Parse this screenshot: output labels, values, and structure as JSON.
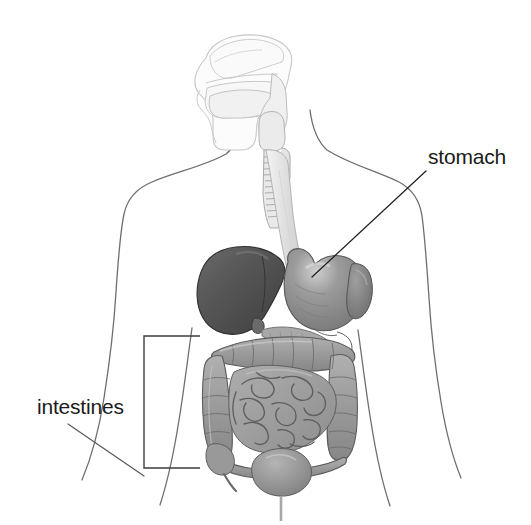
{
  "figure": {
    "kind": "anatomical-illustration",
    "background_color": "#ffffff",
    "width": 531,
    "height": 525
  },
  "labels": [
    {
      "id": "stomach",
      "text": "stomach",
      "color": "#1b1b1b",
      "text_x": 428,
      "text_y": 164,
      "leader": {
        "x1": 426,
        "y1": 171,
        "x2": 312,
        "y2": 277
      },
      "pointer_target": "stomach-organ"
    },
    {
      "id": "intestines",
      "text": "intestines",
      "color": "#1b1b1b",
      "text_x": 37,
      "text_y": 414,
      "leader": {
        "x1": 68,
        "y1": 424,
        "x2": 144,
        "y2": 476
      },
      "pointer_target": "intestines-bracket"
    }
  ],
  "bracket": {
    "name": "intestines-bracket",
    "x": 144,
    "y_top": 336,
    "y_bottom": 468,
    "arm_length": 56,
    "color": "#3d3d3d"
  },
  "body_outline": {
    "color": "#6e6e6e",
    "stroke_width": 1.3,
    "parts": [
      "neck",
      "left-shoulder",
      "right-shoulder",
      "left-arm",
      "right-arm",
      "torso",
      "left-hip",
      "right-hip"
    ]
  },
  "organs": [
    {
      "id": "head-profile",
      "name": "head and mouth cavity",
      "fill": "#fbfbfb",
      "stroke": "#c9c9c9"
    },
    {
      "id": "nasal-cavity",
      "name": "nasal cavity",
      "fill": "#fafafa",
      "stroke": "#c4c4c4"
    },
    {
      "id": "tongue",
      "name": "tongue",
      "fill": "#f6f6f6",
      "stroke": "#c4c4c4"
    },
    {
      "id": "pharynx",
      "name": "pharynx",
      "fill": "#f2f2f2",
      "stroke": "#bdbdbd"
    },
    {
      "id": "trachea",
      "name": "trachea",
      "fill": "#e8e8e8",
      "stroke": "#a8a8a8"
    },
    {
      "id": "esophagus",
      "name": "esophagus",
      "fill": "#ededed",
      "stroke": "#b0b0b0"
    },
    {
      "id": "liver",
      "name": "liver",
      "fill": "#525252",
      "stroke": "#2e2e2e"
    },
    {
      "id": "stomach-organ",
      "name": "stomach",
      "fill": "#8e8e8e",
      "stroke": "#5a5a5a"
    },
    {
      "id": "spleen",
      "name": "spleen",
      "fill": "#7d7d7d",
      "stroke": "#555555"
    },
    {
      "id": "pancreas",
      "name": "pancreas",
      "fill": "#a6a6a6",
      "stroke": "#6e6e6e"
    },
    {
      "id": "large-intestine",
      "name": "large intestine (colon)",
      "fill": "#9c9c9c",
      "stroke": "#5e5e5e"
    },
    {
      "id": "small-intestine",
      "name": "small intestine",
      "fill": "#a2a2a2",
      "stroke": "#5e5e5e"
    },
    {
      "id": "cecum",
      "name": "cecum and appendix",
      "fill": "#9a9a9a",
      "stroke": "#5e5e5e"
    },
    {
      "id": "bladder",
      "name": "bladder",
      "fill": "#8f8f8f",
      "stroke": "#5c5c5c"
    },
    {
      "id": "urethra",
      "name": "urethra",
      "fill": "#b5b5b5",
      "stroke": "#8a8a8a"
    }
  ]
}
